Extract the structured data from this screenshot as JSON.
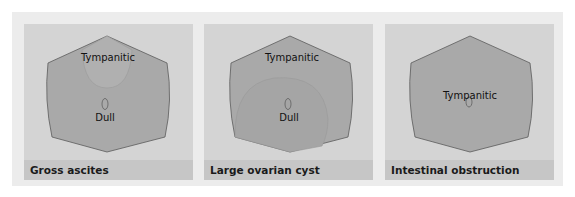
{
  "colors": {
    "background": "#ececec",
    "panel": "#d4d4d4",
    "caption_bar": "#c6c6c6",
    "abdomen": "#a9a9a9",
    "tympanitic_zone": "#b2b2b2",
    "outline": "#5a5a5a"
  },
  "panels": [
    {
      "caption": "Gross ascites",
      "labels": {
        "top": "Tympanitic",
        "bottom": "Dull"
      }
    },
    {
      "caption": "Large ovarian cyst",
      "labels": {
        "top": "Tympanitic",
        "bottom": "Dull"
      }
    },
    {
      "caption": "Intestinal obstruction",
      "labels": {
        "center": "Tympanitic"
      }
    }
  ]
}
